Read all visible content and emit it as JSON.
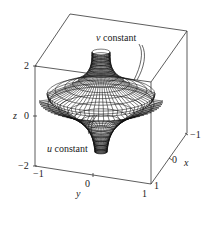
{
  "figure": {
    "type": "3d-parametric-surface-wireframe",
    "annotations": {
      "v_constant": {
        "var": "v",
        "text": "constant"
      },
      "u_constant": {
        "var": "u",
        "text": "constant"
      }
    },
    "axes": {
      "z": {
        "label": "z",
        "ticks": [
          "2",
          "0",
          "−2"
        ],
        "range": [
          -2,
          2
        ]
      },
      "y": {
        "label": "y",
        "ticks": [
          "−1",
          "0",
          "1"
        ],
        "range": [
          -1,
          1
        ]
      },
      "x": {
        "label": "x",
        "ticks": [
          "1",
          "0",
          "−1"
        ],
        "range": [
          -1,
          1
        ]
      }
    },
    "colors": {
      "line": "#222222",
      "box": "#333333",
      "background": "#ffffff"
    }
  },
  "chart_data": {
    "type": "surface",
    "title": "",
    "xlabel": "x",
    "ylabel": "y",
    "zlabel": "z",
    "xlim": [
      -1,
      1
    ],
    "ylim": [
      -1,
      1
    ],
    "zlim": [
      -2,
      2
    ],
    "x_ticks": [
      1,
      0,
      -1
    ],
    "y_ticks": [
      -1,
      0,
      1
    ],
    "z_ticks": [
      2,
      0,
      -2
    ],
    "annotations": [
      "v constant",
      "u constant"
    ],
    "grid": false,
    "box": true
  }
}
